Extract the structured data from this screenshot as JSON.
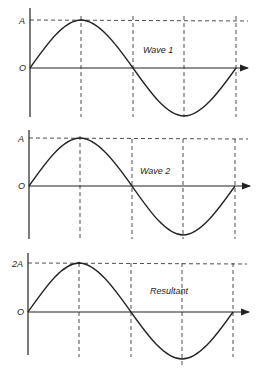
{
  "figure": {
    "panels": [
      {
        "id": "wave1",
        "title": "Wave 1",
        "y_max_label": "A",
        "origin_label": "O",
        "amplitude": 1
      },
      {
        "id": "wave2",
        "title": "Wave 2",
        "y_max_label": "A",
        "origin_label": "O",
        "amplitude": 1
      },
      {
        "id": "resultant",
        "title": "Resultant",
        "y_max_label": "2A",
        "origin_label": "O",
        "amplitude": 2
      }
    ]
  },
  "colors": {
    "line": "#222222",
    "background": "#ffffff"
  }
}
